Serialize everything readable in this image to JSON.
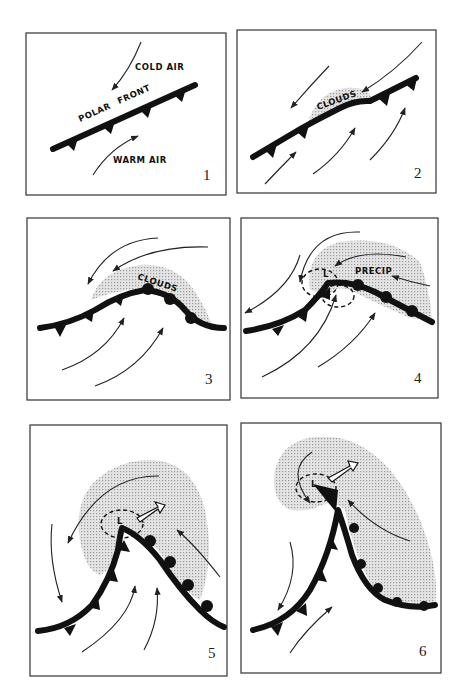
{
  "figure": {
    "panels": [
      {
        "number": "1",
        "labels": {
          "cold_air": "COLD AIR",
          "polar": "POLAR",
          "front": "FRONT",
          "warm_air": "WARM AIR"
        }
      },
      {
        "number": "2",
        "labels": {
          "clouds": "CLOUDS"
        }
      },
      {
        "number": "3",
        "labels": {
          "clouds": "CLOUDS"
        }
      },
      {
        "number": "4",
        "labels": {
          "low": "L",
          "precip": "PRECIP"
        }
      },
      {
        "number": "5",
        "labels": {
          "low": "L"
        }
      },
      {
        "number": "6",
        "labels": {
          "low": "L"
        }
      }
    ]
  }
}
